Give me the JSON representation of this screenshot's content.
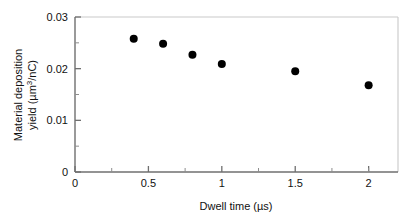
{
  "chart_data": {
    "type": "scatter",
    "title": "",
    "subtitle": "",
    "xlabel": "Dwell time (µs)",
    "ylabel": "Material deposition yield (µm³/nC)",
    "ylabel_line1": "Material deposition",
    "ylabel_line2_pre": "yield (µm",
    "ylabel_line2_sup": "3",
    "ylabel_line2_post": "/nC)",
    "xlim": [
      0,
      2.2
    ],
    "ylim": [
      0,
      0.03
    ],
    "grid": false,
    "legend": false,
    "legend_position": "none",
    "marker": "filled-circle",
    "marker_color": "#000000",
    "marker_size_px": 8,
    "x_ticks": [
      0,
      0.5,
      1,
      1.5,
      2
    ],
    "x_tick_labels": [
      "0",
      "0.5",
      "1",
      "1.5",
      "2"
    ],
    "x_minor_ticks": [
      0.25,
      0.75,
      1.25,
      1.75,
      2.0
    ],
    "y_ticks": [
      0,
      0.01,
      0.02,
      0.03
    ],
    "y_tick_labels": [
      "0",
      "0.01",
      "0.02",
      "0.03"
    ],
    "y_minor_ticks": [
      0.005,
      0.015,
      0.025
    ],
    "x": [
      0.4,
      0.6,
      0.8,
      1.0,
      1.5,
      2.0
    ],
    "values": [
      0.0258,
      0.0248,
      0.0227,
      0.0209,
      0.0195,
      0.0168
    ],
    "series": [
      {
        "name": "Material deposition yield",
        "points": [
          {
            "x": 0.4,
            "y": 0.0258
          },
          {
            "x": 0.6,
            "y": 0.0248
          },
          {
            "x": 0.8,
            "y": 0.0227
          },
          {
            "x": 1.0,
            "y": 0.0209
          },
          {
            "x": 1.5,
            "y": 0.0195
          },
          {
            "x": 2.0,
            "y": 0.0168
          }
        ]
      }
    ]
  },
  "figure": {
    "background_color": "#ffffff",
    "axis_color": "#6f6f6f",
    "text_color": "#111111"
  }
}
